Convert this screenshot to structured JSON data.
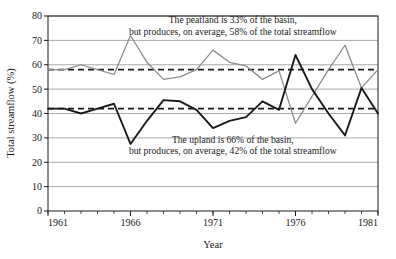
{
  "chart_data": {
    "type": "line",
    "title": "",
    "xlabel": "Year",
    "ylabel": "Total streamflow (%)",
    "xlim": [
      1961,
      1981
    ],
    "ylim": [
      0,
      80
    ],
    "grid": true,
    "legend_position": "none",
    "x_major_ticks": [
      1961,
      1966,
      1971,
      1976,
      1981
    ],
    "x_major_tick_labels": [
      "1961",
      "1966",
      "1971",
      "1976",
      "1981"
    ],
    "x_minor_tick_step": 1,
    "y_ticks": [
      0,
      10,
      20,
      30,
      40,
      50,
      60,
      70,
      80
    ],
    "y_tick_labels": [
      "0",
      "10",
      "20",
      "30",
      "40",
      "50",
      "60",
      "70",
      "80"
    ],
    "x": [
      1961,
      1962,
      1963,
      1964,
      1965,
      1966,
      1967,
      1968,
      1969,
      1970,
      1971,
      1972,
      1973,
      1974,
      1975,
      1976,
      1977,
      1978,
      1979,
      1980,
      1981
    ],
    "series": [
      {
        "name": "peatland",
        "color": "#8c8c8c",
        "style": "solid",
        "values": [
          58,
          58,
          60,
          58,
          56,
          72,
          61,
          54,
          55,
          58,
          66,
          61,
          59.5,
          54,
          57.5,
          36,
          47,
          58,
          68,
          50.5,
          58
        ]
      },
      {
        "name": "upland",
        "color": "#1a1a1a",
        "style": "solid",
        "values": [
          42,
          42,
          40,
          42,
          44,
          27.5,
          37,
          45.5,
          45,
          41.5,
          34,
          37,
          38.5,
          45,
          41.5,
          64,
          50,
          40,
          31,
          50.5,
          40
        ]
      }
    ],
    "reference_lines": [
      {
        "name": "peatland-mean",
        "value": 58,
        "color": "#1a1a1a",
        "style": "dashed"
      },
      {
        "name": "upland-mean",
        "value": 42,
        "color": "#1a1a1a",
        "style": "dashed"
      }
    ],
    "annotations": [
      {
        "name": "peatland-annotation",
        "lines": [
          "The peatland is 33% of the basin,",
          "but produces, on average, 58% of the total streamflow"
        ],
        "x": 1972.2,
        "y": 77
      },
      {
        "name": "upland-annotation",
        "lines": [
          "The upland is 66% of the basin,",
          "but produces, on average, 42% of the total streamflow"
        ],
        "x": 1972.2,
        "y": 28
      }
    ]
  },
  "colors": {
    "gridline": "#a8a8a8",
    "axis": "#1a1a1a",
    "peatland_line": "#8c8c8c",
    "upland_line": "#1a1a1a",
    "background": "#ffffff"
  }
}
